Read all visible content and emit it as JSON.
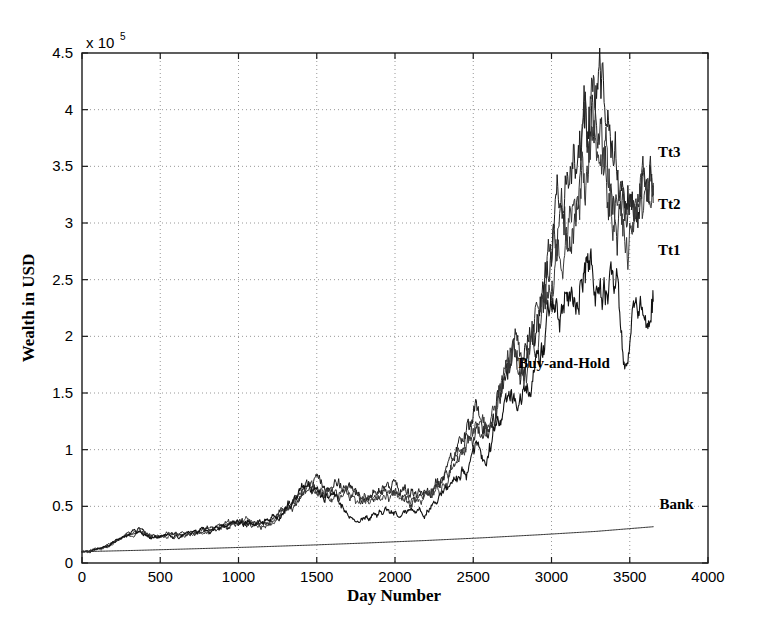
{
  "chart_data": {
    "type": "line",
    "title": "",
    "xlabel": "Day Number",
    "ylabel": "Wealth in USD",
    "y_multiplier_label": "x 10",
    "y_multiplier_exponent": "5",
    "xlim": [
      0,
      4000
    ],
    "ylim": [
      0,
      450000
    ],
    "grid": true,
    "grid_style": "dotted",
    "legend_position": "inline-right",
    "xticks": [
      0,
      500,
      1000,
      1500,
      2000,
      2500,
      3000,
      3500,
      4000
    ],
    "xticklabels": [
      "0",
      "500",
      "1000",
      "1500",
      "2000",
      "2500",
      "3000",
      "3500",
      "4000"
    ],
    "yticks": [
      0,
      50000,
      100000,
      150000,
      200000,
      250000,
      300000,
      350000,
      400000,
      450000
    ],
    "yticklabels": [
      "0",
      "0.5",
      "1",
      "1.5",
      "2",
      "2.5",
      "3",
      "3.5",
      "4",
      "4.5"
    ],
    "annotations": [
      {
        "text": "Tt3",
        "x": 3680,
        "y": 358000
      },
      {
        "text": "Tt2",
        "x": 3680,
        "y": 312000
      },
      {
        "text": "Tt1",
        "x": 3680,
        "y": 272000
      },
      {
        "text": "Buy-and-Hold",
        "x": 3080,
        "y": 172000
      },
      {
        "text": "Bank",
        "x": 3690,
        "y": 48000
      }
    ],
    "series": [
      {
        "name": "Tt3",
        "color": "#1a1a1a",
        "final_value": 335000,
        "peak_value": 405000,
        "x": [
          0,
          60,
          120,
          180,
          240,
          300,
          360,
          420,
          480,
          540,
          600,
          660,
          720,
          780,
          840,
          900,
          960,
          1020,
          1080,
          1140,
          1200,
          1260,
          1320,
          1380,
          1440,
          1500,
          1560,
          1620,
          1680,
          1740,
          1800,
          1860,
          1920,
          1980,
          2040,
          2100,
          2160,
          2220,
          2280,
          2340,
          2400,
          2460,
          2520,
          2580,
          2640,
          2700,
          2760,
          2820,
          2880,
          2940,
          3000,
          3060,
          3120,
          3180,
          3240,
          3300,
          3360,
          3420,
          3480,
          3540,
          3600,
          3650
        ],
        "values": [
          10000,
          11000,
          13500,
          17000,
          22000,
          26000,
          30000,
          25000,
          23500,
          24500,
          25500,
          26000,
          27500,
          29000,
          31000,
          33000,
          35000,
          37500,
          36000,
          34500,
          37000,
          42000,
          51000,
          60000,
          68000,
          66500,
          65000,
          66000,
          67000,
          63000,
          60000,
          61000,
          64000,
          66500,
          65000,
          62000,
          61000,
          65000,
          72000,
          80000,
          96000,
          110000,
          128000,
          120000,
          140000,
          165000,
          190000,
          178000,
          205000,
          240000,
          285000,
          300000,
          330000,
          360000,
          395000,
          405000,
          360000,
          330000,
          300000,
          330000,
          345000,
          335000
        ]
      },
      {
        "name": "Tt2",
        "color": "#2a2a2a",
        "final_value": 325000,
        "peak_value": 395000,
        "x": [
          0,
          60,
          120,
          180,
          240,
          300,
          360,
          420,
          480,
          540,
          600,
          660,
          720,
          780,
          840,
          900,
          960,
          1020,
          1080,
          1140,
          1200,
          1260,
          1320,
          1380,
          1440,
          1500,
          1560,
          1620,
          1680,
          1740,
          1800,
          1860,
          1920,
          1980,
          2040,
          2100,
          2160,
          2220,
          2280,
          2340,
          2400,
          2460,
          2520,
          2580,
          2640,
          2700,
          2760,
          2820,
          2880,
          2940,
          3000,
          3060,
          3120,
          3180,
          3240,
          3300,
          3360,
          3420,
          3480,
          3540,
          3600,
          3650
        ],
        "values": [
          10000,
          10800,
          13000,
          16500,
          21500,
          25500,
          29500,
          24500,
          23000,
          24000,
          25000,
          25500,
          27000,
          28500,
          30500,
          32500,
          34500,
          37000,
          35500,
          34000,
          36500,
          41500,
          50000,
          59000,
          67000,
          65000,
          63000,
          62500,
          63500,
          59000,
          57000,
          58000,
          61000,
          63500,
          62000,
          59500,
          58500,
          62500,
          69500,
          77500,
          93000,
          107000,
          124000,
          116000,
          136000,
          160000,
          185000,
          173000,
          199000,
          233000,
          277000,
          292000,
          320000,
          350000,
          385000,
          393000,
          350000,
          320000,
          290000,
          320000,
          335000,
          325000
        ]
      },
      {
        "name": "Tt1",
        "color": "#3a3a3a",
        "final_value": 318000,
        "peak_value": 388000,
        "x": [
          0,
          60,
          120,
          180,
          240,
          300,
          360,
          420,
          480,
          540,
          600,
          660,
          720,
          780,
          840,
          900,
          960,
          1020,
          1080,
          1140,
          1200,
          1260,
          1320,
          1380,
          1440,
          1500,
          1560,
          1620,
          1680,
          1740,
          1800,
          1860,
          1920,
          1980,
          2040,
          2100,
          2160,
          2220,
          2280,
          2340,
          2400,
          2460,
          2520,
          2580,
          2640,
          2700,
          2760,
          2820,
          2880,
          2940,
          3000,
          3060,
          3120,
          3180,
          3240,
          3300,
          3360,
          3420,
          3480,
          3540,
          3600,
          3650
        ],
        "values": [
          10000,
          10600,
          12700,
          16000,
          21000,
          25000,
          29000,
          24000,
          22500,
          23500,
          24500,
          25000,
          26500,
          28000,
          30000,
          32000,
          34000,
          36500,
          35000,
          33500,
          36000,
          41000,
          49000,
          58000,
          66000,
          63500,
          60000,
          59000,
          59500,
          55000,
          53500,
          55000,
          58000,
          61000,
          59000,
          56500,
          56000,
          60000,
          67000,
          75000,
          90000,
          104000,
          120000,
          112000,
          132000,
          156000,
          180000,
          168000,
          194000,
          228000,
          271000,
          285000,
          313000,
          342000,
          377000,
          385000,
          343000,
          313000,
          284000,
          313000,
          328000,
          318000
        ]
      },
      {
        "name": "Buy-and-Hold",
        "color": "#111111",
        "final_value": 231000,
        "peak_value": 262000,
        "x": [
          0,
          60,
          120,
          180,
          240,
          300,
          360,
          420,
          480,
          540,
          600,
          660,
          720,
          780,
          840,
          900,
          960,
          1020,
          1080,
          1140,
          1200,
          1260,
          1320,
          1380,
          1440,
          1500,
          1560,
          1620,
          1680,
          1740,
          1800,
          1860,
          1920,
          1980,
          2040,
          2100,
          2160,
          2220,
          2280,
          2340,
          2400,
          2460,
          2520,
          2580,
          2640,
          2700,
          2760,
          2820,
          2880,
          2940,
          3000,
          3060,
          3120,
          3180,
          3240,
          3300,
          3360,
          3420,
          3480,
          3540,
          3600,
          3650
        ],
        "values": [
          10000,
          10800,
          13000,
          16500,
          21500,
          25500,
          29500,
          24500,
          23000,
          24000,
          25000,
          25500,
          27000,
          28500,
          30500,
          32500,
          34500,
          37000,
          35500,
          34000,
          36500,
          41500,
          50000,
          59000,
          67000,
          64000,
          60000,
          55000,
          47000,
          41000,
          39000,
          42000,
          46000,
          48000,
          44000,
          42000,
          44000,
          48000,
          55000,
          62000,
          74000,
          86000,
          100000,
          92000,
          108000,
          128000,
          148000,
          138000,
          158000,
          185000,
          218000,
          228000,
          245000,
          258000,
          262000,
          250000,
          228000,
          245000,
          178000,
          210000,
          232000,
          231000
        ]
      },
      {
        "name": "Bank",
        "color": "#333333",
        "final_value": 32000,
        "peak_value": 32000,
        "x": [
          0,
          365,
          730,
          1095,
          1460,
          1825,
          2190,
          2555,
          2920,
          3285,
          3650
        ],
        "values": [
          10000,
          11200,
          12600,
          14100,
          15800,
          17700,
          19800,
          22200,
          24900,
          27900,
          32000
        ]
      }
    ]
  },
  "axes": {
    "x_label": "Day Number",
    "y_label": "Wealth in USD",
    "exponent_prefix": "x 10",
    "exponent_value": "5"
  }
}
